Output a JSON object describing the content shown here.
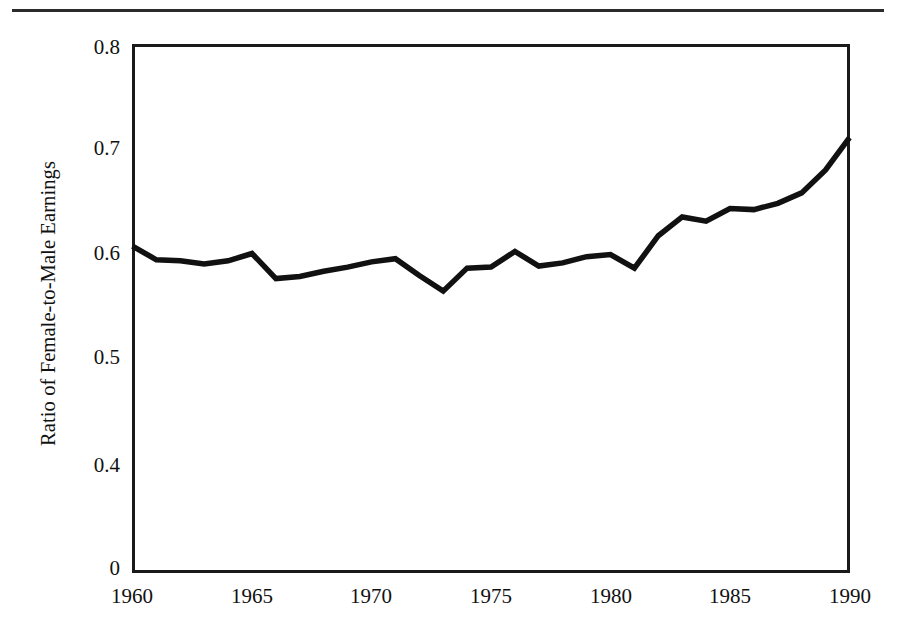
{
  "figure": {
    "has_top_rule": true,
    "background_color": "#ffffff",
    "line_color": "#111111",
    "axis_color": "#1a1a1a"
  },
  "axes": {
    "y_axis_title": "Ratio of Female-to-Male Earnings",
    "y_tick_labels": [
      "0.8",
      "0.7",
      "0.6",
      "0.5",
      "0.4",
      "0"
    ],
    "y_tick_values": [
      0.8,
      0.7,
      0.6,
      0.5,
      0.4,
      0
    ],
    "x_tick_labels": [
      "1960",
      "1965",
      "1970",
      "1975",
      "1980",
      "1985",
      "1990"
    ],
    "x_tick_values": [
      1960,
      1965,
      1970,
      1975,
      1980,
      1985,
      1990
    ],
    "axis_break_note": "y axis is broken between 0.4 and 0"
  },
  "chart_data": {
    "type": "line",
    "title": "",
    "xlabel": "",
    "ylabel": "Ratio of Female-to-Male Earnings",
    "xlim": [
      1960,
      1990
    ],
    "ylim": [
      0.4,
      0.8
    ],
    "ylim_displayed": [
      0,
      0.8
    ],
    "grid": false,
    "legend": null,
    "x": [
      1960,
      1961,
      1962,
      1963,
      1964,
      1965,
      1966,
      1967,
      1968,
      1969,
      1970,
      1971,
      1972,
      1973,
      1974,
      1975,
      1976,
      1977,
      1978,
      1979,
      1980,
      1981,
      1982,
      1983,
      1984,
      1985,
      1986,
      1987,
      1988,
      1989,
      1990
    ],
    "series": [
      {
        "name": "Ratio of Female-to-Male Earnings",
        "values": [
          0.607,
          0.594,
          0.593,
          0.59,
          0.593,
          0.6,
          0.576,
          0.578,
          0.583,
          0.587,
          0.592,
          0.595,
          0.579,
          0.564,
          0.586,
          0.587,
          0.602,
          0.588,
          0.591,
          0.597,
          0.599,
          0.586,
          0.617,
          0.635,
          0.631,
          0.643,
          0.642,
          0.648,
          0.658,
          0.68,
          0.711
        ]
      }
    ]
  }
}
